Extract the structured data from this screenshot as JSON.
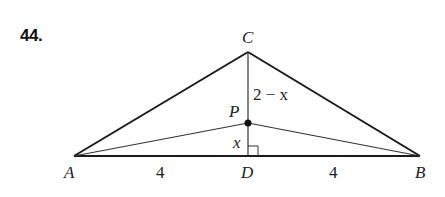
{
  "problem": {
    "number": "44."
  },
  "diagram": {
    "colors": {
      "stroke": "#1a1a1a",
      "thin_stroke": "#333333",
      "text": "#222222"
    },
    "points": {
      "A": {
        "label": "A",
        "x": 74,
        "y": 156
      },
      "B": {
        "label": "B",
        "x": 420,
        "y": 156
      },
      "C": {
        "label": "C",
        "x": 248,
        "y": 52
      },
      "D": {
        "label": "D",
        "x": 248,
        "y": 156
      },
      "P": {
        "label": "P",
        "x": 248,
        "y": 123
      }
    },
    "segment_labels": {
      "AD": "4",
      "DB": "4",
      "PC": "2 − x",
      "DP": "x"
    },
    "annotations": {
      "right_angle_at": "D"
    }
  }
}
